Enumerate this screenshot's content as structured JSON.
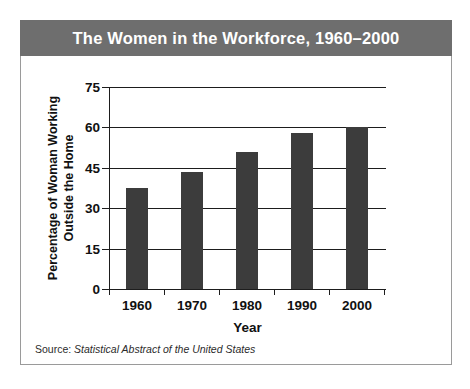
{
  "figure": {
    "title": "The Women in the Workforce, 1960–2000",
    "source_prefix": "Source:",
    "source_title": "Statistical Abstract of the United States",
    "title_bar_color": "#6e6e6e",
    "title_text_color": "#ffffff",
    "bar_color": "#3c3c3c",
    "panel_border_color": "#9a9a9a",
    "axis_color": "#1d1d1d"
  },
  "chart_data": {
    "type": "bar",
    "title": "The Women in the Workforce, 1960–2000",
    "xlabel": "Year",
    "ylabel": "Percentage of Woman Working Outside the Home",
    "ylabel_line1": "Percentage of Woman Working",
    "ylabel_line2": "Outside the Home",
    "categories": [
      "1960",
      "1970",
      "1980",
      "1990",
      "2000"
    ],
    "values": [
      37.5,
      43.5,
      51,
      58,
      60
    ],
    "ylim": [
      0,
      75
    ],
    "yticks": [
      0,
      15,
      30,
      45,
      60,
      75
    ],
    "ytick_labels": [
      "0",
      "15",
      "30",
      "45",
      "60",
      "75"
    ],
    "grid": true,
    "legend": false
  }
}
